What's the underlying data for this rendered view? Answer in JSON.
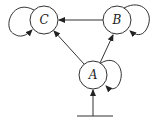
{
  "diagram": {
    "type": "state-graph",
    "nodes": [
      {
        "id": "C",
        "label": "C",
        "cx": 44,
        "cy": 20,
        "r": 14,
        "self_loop": "left"
      },
      {
        "id": "B",
        "label": "B",
        "cx": 117,
        "cy": 20,
        "r": 14,
        "self_loop": "right"
      },
      {
        "id": "A",
        "label": "A",
        "cx": 93,
        "cy": 75,
        "r": 14,
        "self_loop": "right"
      }
    ],
    "edges": [
      {
        "from": "B",
        "to": "C"
      },
      {
        "from": "A",
        "to": "C"
      },
      {
        "from": "A",
        "to": "B"
      },
      {
        "from": "input",
        "to": "A"
      }
    ],
    "input_bar": {
      "x1": 77,
      "x2": 113,
      "y": 116
    },
    "colors": {
      "stroke": "#333333",
      "background": "#ffffff"
    }
  }
}
